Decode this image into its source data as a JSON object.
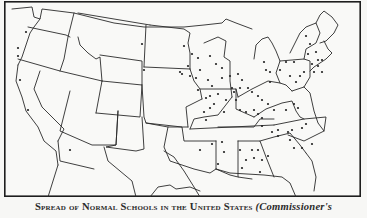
{
  "figure": {
    "type": "map",
    "caption": {
      "main": "Spread of Normal Schools in the United States",
      "source": "(Commissioner's"
    },
    "colors": {
      "background": "#f7f7f5",
      "ink": "#1e1e1e",
      "dot": "#222222"
    }
  },
  "map": {
    "borders": [
      "M8,8 L28,6 L30,16 L36,18 L38,8 L70,12 L110,22 L140,26 L180,26 L200,24 L218,22 L222,18 L232,22 L248,28",
      "M36,18 L30,26 L26,32 L22,44 L18,56 L14,64",
      "M14,64 L12,80 L18,96 L22,110 L34,126 L40,140 L52,150 L54,164",
      "M24,26 L62,34 L66,36",
      "M70,12 L64,36 L60,58 L56,70",
      "M14,58 L56,70 L98,80",
      "M36,70 L30,88 L38,106 L60,128 L54,140",
      "M74,36 L76,44 L84,52 L92,58 L96,56 L98,80",
      "M98,80 L92,112",
      "M74,12 L146,24",
      "M142,24 L140,66",
      "M96,54 L138,60 L138,84 L98,80",
      "M92,112 L136,116 L138,84",
      "M66,90 L56,130 L88,144 L112,144 L114,110",
      "M54,140 L56,160 L90,168",
      "M114,110 L112,144 L102,146 L132,150 L140,148 L138,116",
      "M138,84 L140,116 L142,122 L164,126 L184,126",
      "M140,66 L186,68",
      "M146,24 L180,28 L186,32 L184,42 L186,52 L186,68",
      "M186,68 L190,80 L196,88 L198,98",
      "M184,126 L182,106 L198,98",
      "M142,122 L178,126 L180,140 L212,140",
      "M200,42 L214,36 L222,40 L220,56 L226,60 L226,80 L228,96",
      "M196,88 L232,88 L234,96",
      "M228,96 L214,114 L200,116 L190,118 L186,128",
      "M232,88 L232,108 L250,116",
      "M214,126 L250,126 L256,118 L270,118",
      "M186,128 L270,124",
      "M212,140 L212,168 L226,174 L234,176",
      "M234,140 L234,176 L248,178",
      "M234,140 L256,140 L262,156 L270,176",
      "M256,140 L270,136 L286,132 L296,144 L302,152",
      "M270,124 L300,118 L322,116 L320,130 L300,140 L284,134",
      "M250,116 L262,108 L278,102 L288,100 L292,110 L296,116 L300,118",
      "M234,96 L248,88 L256,84 L264,80 L276,82 L282,84 L288,90",
      "M250,58 L252,44 L258,38 L264,36 L268,42 L272,50 L276,60 L272,72 L276,82",
      "M276,60 L300,58 L306,60 L306,76 L300,86 L288,90",
      "M286,52 L290,44 L296,32 L302,26 L312,22 L316,32 L312,42 L302,48 L300,58",
      "M312,22 L316,14 L320,10 L328,16 L334,24 L330,32 L322,40 L316,42",
      "M320,40 L324,48 L328,52 L322,58 L316,62 L310,66 L306,70",
      "M300,86 L306,92 L310,110 L314,122 L320,130",
      "M164,126 L160,146 L166,160 L190,168 L206,172 L212,168",
      "M212,168 L226,172 L260,174 L278,176 L286,182 L292,196",
      "M302,152 L308,160 L312,176 L310,190",
      "M100,146 L104,160 L116,170 L128,180 L132,196",
      "M160,150 L170,156 L180,170 L190,186 L196,196",
      "M44,196 L54,164",
      "M146,196 L154,186 L166,184 L172,188 L186,186 L196,190"
    ],
    "dots": [
      [
        26,
        32
      ],
      [
        18,
        48
      ],
      [
        18,
        56
      ],
      [
        20,
        80
      ],
      [
        28,
        110
      ],
      [
        70,
        150
      ],
      [
        144,
        70
      ],
      [
        142,
        44
      ],
      [
        180,
        72
      ],
      [
        182,
        74
      ],
      [
        184,
        46
      ],
      [
        192,
        54
      ],
      [
        188,
        66
      ],
      [
        190,
        76
      ],
      [
        196,
        78
      ],
      [
        200,
        70
      ],
      [
        198,
        58
      ],
      [
        210,
        56
      ],
      [
        216,
        64
      ],
      [
        222,
        68
      ],
      [
        222,
        78
      ],
      [
        234,
        92
      ],
      [
        236,
        100
      ],
      [
        208,
        80
      ],
      [
        212,
        86
      ],
      [
        206,
        98
      ],
      [
        210,
        108
      ],
      [
        204,
        112
      ],
      [
        206,
        120
      ],
      [
        198,
        90
      ],
      [
        210,
        96
      ],
      [
        214,
        104
      ],
      [
        218,
        94
      ],
      [
        226,
        100
      ],
      [
        224,
        112
      ],
      [
        240,
        110
      ],
      [
        246,
        112
      ],
      [
        230,
        76
      ],
      [
        238,
        74
      ],
      [
        242,
        80
      ],
      [
        240,
        88
      ],
      [
        232,
        88
      ],
      [
        248,
        88
      ],
      [
        252,
        92
      ],
      [
        258,
        96
      ],
      [
        262,
        100
      ],
      [
        268,
        104
      ],
      [
        274,
        110
      ],
      [
        254,
        110
      ],
      [
        258,
        114
      ],
      [
        262,
        118
      ],
      [
        286,
        110
      ],
      [
        294,
        104
      ],
      [
        298,
        108
      ],
      [
        262,
        126
      ],
      [
        272,
        132
      ],
      [
        278,
        130
      ],
      [
        288,
        132
      ],
      [
        292,
        130
      ],
      [
        302,
        128
      ],
      [
        306,
        124
      ],
      [
        278,
        136
      ],
      [
        290,
        140
      ],
      [
        294,
        148
      ],
      [
        302,
        148
      ],
      [
        312,
        144
      ],
      [
        252,
        150
      ],
      [
        254,
        158
      ],
      [
        258,
        150
      ],
      [
        262,
        160
      ],
      [
        268,
        156
      ],
      [
        260,
        172
      ],
      [
        240,
        150
      ],
      [
        246,
        160
      ],
      [
        242,
        168
      ],
      [
        222,
        142
      ],
      [
        224,
        152
      ],
      [
        218,
        164
      ],
      [
        200,
        150
      ],
      [
        212,
        144
      ],
      [
        270,
        72
      ],
      [
        280,
        70
      ],
      [
        286,
        62
      ],
      [
        294,
        62
      ],
      [
        290,
        76
      ],
      [
        296,
        82
      ],
      [
        300,
        76
      ],
      [
        304,
        72
      ],
      [
        264,
        62
      ],
      [
        266,
        70
      ],
      [
        270,
        82
      ],
      [
        306,
        36
      ],
      [
        310,
        44
      ],
      [
        308,
        54
      ],
      [
        316,
        52
      ],
      [
        318,
        60
      ],
      [
        312,
        64
      ],
      [
        318,
        66
      ],
      [
        322,
        60
      ],
      [
        314,
        72
      ],
      [
        322,
        72
      ]
    ]
  }
}
